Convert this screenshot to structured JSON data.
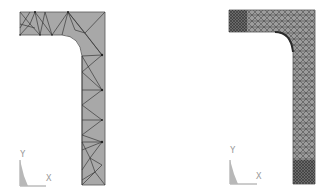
{
  "figure": {
    "panels": [
      {
        "id": "coarse-mesh",
        "description": "Coarse triangular finite element mesh of L-shaped bracket with inner fillet",
        "triad": {
          "y_label": "Y",
          "x_label": "X"
        }
      },
      {
        "id": "fine-mesh",
        "description": "Refined triangular finite element mesh of L-shaped bracket with inner fillet",
        "triad": {
          "y_label": "Y",
          "x_label": "X"
        }
      }
    ],
    "colors": {
      "fill": "#a8a8a8",
      "mesh_line": "#3a3a3a",
      "triad": "#9a9a9a",
      "background": "#ffffff"
    }
  }
}
